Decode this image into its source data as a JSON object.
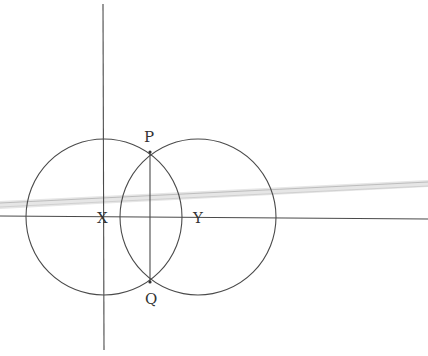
{
  "diagram": {
    "labels": {
      "P": "P",
      "Q": "Q",
      "X": "X",
      "Y": "Y"
    },
    "points": {
      "X": [
        104,
        217
      ],
      "Y": [
        198,
        217
      ],
      "P": [
        150,
        152
      ],
      "Q": [
        150,
        282
      ]
    },
    "circles": [
      {
        "center": "X",
        "cx": 104,
        "cy": 217,
        "r": 78
      },
      {
        "center": "Y",
        "cx": 198,
        "cy": 217,
        "r": 78
      }
    ],
    "colors": {
      "stroke": "#4a4a4a",
      "ruler_shadow": "#c8c8c8",
      "background": "#ffffff"
    }
  }
}
